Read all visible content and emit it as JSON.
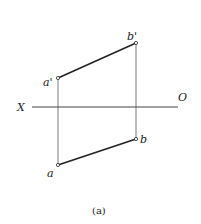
{
  "diagram": {
    "caption": "(a)",
    "axis": {
      "left_label": "X",
      "right_label": "O"
    },
    "points": {
      "a_prime": {
        "label": "a'",
        "x": 58,
        "y": 78
      },
      "b_prime": {
        "label": "b'",
        "x": 136,
        "y": 43
      },
      "a": {
        "label": "a",
        "x": 58,
        "y": 165
      },
      "b": {
        "label": "b",
        "x": 136,
        "y": 139
      }
    },
    "colors": {
      "line": "#333333",
      "background": "#ffffff"
    }
  }
}
